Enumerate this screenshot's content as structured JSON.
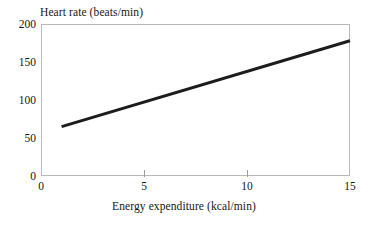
{
  "chart_data": {
    "type": "line",
    "title": "Heart rate (beats/min)",
    "xlabel": "Energy expenditure (kcal/min)",
    "ylabel": "Heart rate (beats/min)",
    "xlim": [
      0,
      15
    ],
    "ylim": [
      0,
      200
    ],
    "xticks": [
      0,
      5,
      10,
      15
    ],
    "xtick_labels": [
      "0",
      "5",
      "10",
      "15"
    ],
    "yticks": [
      0,
      50,
      100,
      150,
      200
    ],
    "ytick_labels": [
      "0",
      "50",
      "100",
      "150",
      "200"
    ],
    "grid": false,
    "legend": false,
    "series": [
      {
        "name": "Heart rate",
        "color": "#1c1c1c",
        "line_width": 3,
        "x": [
          1,
          15
        ],
        "values": [
          65,
          178
        ],
        "points": [
          {
            "x": 1,
            "y": 65
          },
          {
            "x": 15,
            "y": 178
          }
        ]
      }
    ],
    "annotations": []
  },
  "figure": {
    "background_color": "#ffffff",
    "frame_color": "#b9b9b9",
    "tick_color": "#9c9c9c",
    "text_color": "#161616"
  }
}
